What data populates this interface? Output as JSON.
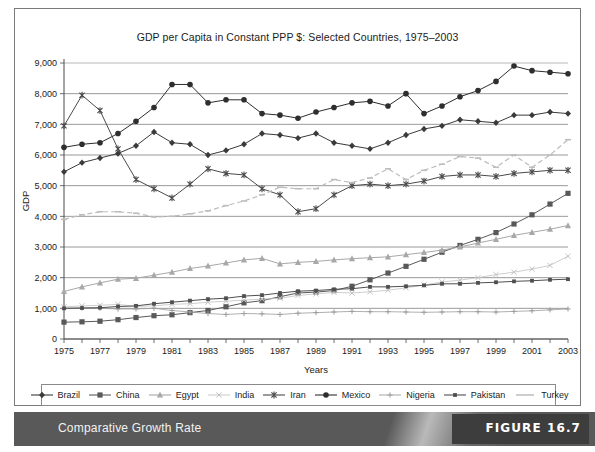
{
  "figure": {
    "caption": "Comparative Growth Rate",
    "number_label": "FIGURE 16.7"
  },
  "chart_data": {
    "type": "line",
    "title": "GDP per Capita in Constant PPP $: Selected Countries, 1975–2003",
    "xlabel": "Years",
    "ylabel": "GDP",
    "grid": true,
    "legend_position": "bottom",
    "xlim": [
      1975,
      2003
    ],
    "ylim": [
      0,
      9000
    ],
    "ytick_step": 1000,
    "yticks": [
      "0",
      "1,000",
      "2,000",
      "3,000",
      "4,000",
      "5,000",
      "6,000",
      "7,000",
      "8,000",
      "9,000"
    ],
    "xticks": [
      "1975",
      "1977",
      "1979",
      "1981",
      "1983",
      "1985",
      "1987",
      "1989",
      "1991",
      "1993",
      "1995",
      "1997",
      "1999",
      "2001",
      "2003"
    ],
    "x": [
      1975,
      1976,
      1977,
      1978,
      1979,
      1980,
      1981,
      1982,
      1983,
      1984,
      1985,
      1986,
      1987,
      1988,
      1989,
      1990,
      1991,
      1992,
      1993,
      1994,
      1995,
      1996,
      1997,
      1998,
      1999,
      2000,
      2001,
      2002,
      2003
    ],
    "series": [
      {
        "name": "Brazil",
        "marker": "diamond",
        "color": "#3a3a3a",
        "values": [
          5450,
          5750,
          5900,
          6050,
          6300,
          6750,
          6400,
          6350,
          6000,
          6150,
          6350,
          6700,
          6650,
          6550,
          6700,
          6400,
          6300,
          6200,
          6400,
          6650,
          6850,
          6950,
          7150,
          7100,
          7050,
          7300,
          7300,
          7400,
          7350
        ]
      },
      {
        "name": "China",
        "marker": "square",
        "color": "#595959",
        "values": [
          550,
          560,
          580,
          630,
          700,
          760,
          790,
          860,
          930,
          1050,
          1180,
          1250,
          1380,
          1500,
          1530,
          1580,
          1720,
          1930,
          2150,
          2370,
          2600,
          2830,
          3050,
          3250,
          3470,
          3750,
          4050,
          4400,
          4750
        ]
      },
      {
        "name": "Egypt",
        "marker": "triangle",
        "color": "#a8a8a8",
        "values": [
          1550,
          1700,
          1830,
          1950,
          1980,
          2080,
          2180,
          2300,
          2380,
          2480,
          2580,
          2630,
          2450,
          2500,
          2530,
          2580,
          2620,
          2650,
          2680,
          2750,
          2820,
          2900,
          3000,
          3130,
          3250,
          3380,
          3480,
          3580,
          3700
        ]
      },
      {
        "name": "India",
        "marker": "x-light",
        "color": "#c2c2c2",
        "values": [
          1050,
          1080,
          1100,
          1130,
          1060,
          1080,
          1130,
          1150,
          1200,
          1230,
          1270,
          1300,
          1330,
          1420,
          1470,
          1520,
          1500,
          1540,
          1590,
          1670,
          1760,
          1860,
          1920,
          2000,
          2100,
          2180,
          2280,
          2400,
          2700
        ]
      },
      {
        "name": "Iran",
        "marker": "asterisk",
        "color": "#4a4a4a",
        "values": [
          6950,
          7950,
          7450,
          6200,
          5200,
          4900,
          4600,
          5050,
          5550,
          5400,
          5350,
          4900,
          4700,
          4150,
          4250,
          4700,
          5000,
          5050,
          5000,
          5050,
          5150,
          5300,
          5350,
          5350,
          5300,
          5400,
          5450,
          5500,
          5500
        ]
      },
      {
        "name": "Mexico",
        "marker": "circle",
        "color": "#2e2e2e",
        "values": [
          6250,
          6350,
          6400,
          6700,
          7100,
          7550,
          8300,
          8300,
          7700,
          7800,
          7800,
          7350,
          7300,
          7200,
          7400,
          7550,
          7700,
          7750,
          7600,
          8000,
          7350,
          7600,
          7900,
          8100,
          8400,
          8900,
          8750,
          8700,
          8650
        ]
      },
      {
        "name": "Nigeria",
        "marker": "plus",
        "color": "#9c9c9c",
        "values": [
          1000,
          1010,
          1000,
          980,
          980,
          1000,
          930,
          880,
          830,
          800,
          830,
          820,
          800,
          840,
          860,
          880,
          900,
          890,
          890,
          880,
          870,
          880,
          890,
          890,
          880,
          900,
          920,
          950,
          980
        ]
      },
      {
        "name": "Pakistan",
        "marker": "dash-square",
        "color": "#4f4f4f",
        "values": [
          1000,
          1010,
          1020,
          1060,
          1080,
          1150,
          1200,
          1250,
          1300,
          1330,
          1400,
          1430,
          1500,
          1560,
          1580,
          1620,
          1640,
          1700,
          1700,
          1720,
          1750,
          1800,
          1800,
          1830,
          1850,
          1880,
          1900,
          1930,
          1950
        ]
      },
      {
        "name": "Turkey",
        "marker": "dash-light",
        "color": "#bdbdbd",
        "values": [
          3900,
          4050,
          4150,
          4150,
          4100,
          3980,
          4000,
          4080,
          4180,
          4350,
          4500,
          4700,
          4950,
          4900,
          4900,
          5200,
          5100,
          5250,
          5550,
          5200,
          5500,
          5700,
          5950,
          5900,
          5600,
          6000,
          5600,
          6000,
          6500
        ]
      }
    ]
  }
}
